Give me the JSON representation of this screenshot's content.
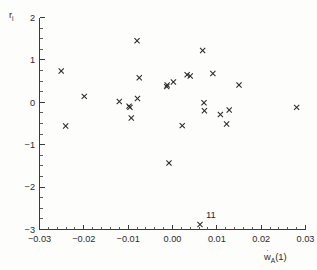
{
  "figure": {
    "background_color": "#fdfdfc",
    "marker_color": "#2a2a2a",
    "axis_color": "#3a3a3a"
  },
  "chart_data": {
    "type": "scatter",
    "title": "",
    "xlabel": "wA(1)",
    "xlabel_parts": {
      "base": "w",
      "accent": "dot",
      "sub": "A",
      "suffix": "(1)"
    },
    "ylabel": "ri",
    "ylabel_parts": {
      "base": "r",
      "sub": "i"
    },
    "xlim": [
      -0.03,
      0.03
    ],
    "ylim": [
      -3,
      2
    ],
    "grid": false,
    "legend": null,
    "xticks": [
      -0.03,
      -0.02,
      -0.01,
      0.0,
      0.01,
      0.02,
      0.03
    ],
    "xticklabels": [
      "-0.03",
      "-0.02",
      "-0.01",
      "0.00",
      "0.01",
      "0.02",
      "0.03"
    ],
    "yticks": [
      2,
      1,
      0,
      -1,
      -2,
      -3
    ],
    "yticklabels": [
      "2",
      "1",
      "0",
      "-1",
      "-2",
      "-3"
    ],
    "x_minor_tick_step": 0.002,
    "y_minor_tick_step": 0.25,
    "marker_symbol": "x",
    "points": [
      {
        "x": -0.0251,
        "y": 0.74
      },
      {
        "x": -0.0241,
        "y": -0.56
      },
      {
        "x": -0.0199,
        "y": 0.14
      },
      {
        "x": -0.012,
        "y": 0.02
      },
      {
        "x": -0.0098,
        "y": -0.09
      },
      {
        "x": -0.0096,
        "y": -0.12
      },
      {
        "x": -0.0093,
        "y": -0.37
      },
      {
        "x": -0.008,
        "y": 1.45
      },
      {
        "x": -0.0079,
        "y": 0.09
      },
      {
        "x": -0.0075,
        "y": 0.58
      },
      {
        "x": -0.0013,
        "y": 0.37
      },
      {
        "x": -0.0012,
        "y": 0.41
      },
      {
        "x": -0.0008,
        "y": -1.43
      },
      {
        "x": 0.0002,
        "y": 0.48
      },
      {
        "x": 0.0022,
        "y": -0.55
      },
      {
        "x": 0.0033,
        "y": 0.65
      },
      {
        "x": 0.004,
        "y": 0.62
      },
      {
        "x": 0.0062,
        "y": -2.88
      },
      {
        "x": 0.0068,
        "y": 1.22
      },
      {
        "x": 0.0071,
        "y": -0.01
      },
      {
        "x": 0.0072,
        "y": -0.2
      },
      {
        "x": 0.0091,
        "y": 0.68
      },
      {
        "x": 0.0108,
        "y": -0.29
      },
      {
        "x": 0.0122,
        "y": -0.51
      },
      {
        "x": 0.0128,
        "y": -0.18
      },
      {
        "x": 0.015,
        "y": 0.41
      },
      {
        "x": 0.028,
        "y": -0.12
      }
    ],
    "annotations": [
      {
        "text": "11",
        "x": 0.0062,
        "y": -2.88,
        "dx": 6,
        "dy": -6
      }
    ]
  }
}
